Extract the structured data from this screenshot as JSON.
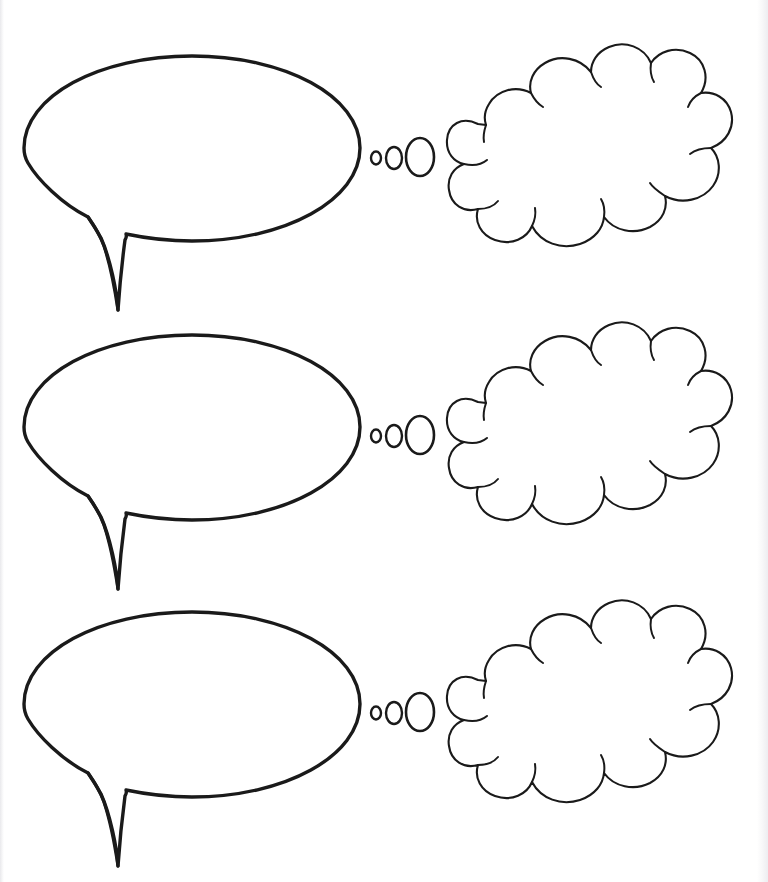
{
  "page": {
    "background_color": "#ffffff",
    "ink_color": "#1a1a1a",
    "page_edge_color": "#e9e9ec",
    "width": 768,
    "height": 882,
    "header_clipped_text": "",
    "orientation": "portrait"
  },
  "rows": [
    {
      "index": 1,
      "label": "bubble-pair-row-1",
      "speech_bubble": {
        "name": "speech-bubble-1",
        "shape": "ellipse-with-tail",
        "center_x": 192,
        "center_y": 148,
        "radius_x": 168,
        "radius_y": 93,
        "tail_direction": "down-left",
        "fill": "#ffffff",
        "stroke": "#1a1a1a",
        "stroke_width": 3.4,
        "content": ""
      },
      "dots": {
        "name": "thought-trail-1",
        "count": 3,
        "sizes": [
          "small",
          "medium",
          "large"
        ],
        "center_y": 158
      },
      "thought_bubble": {
        "name": "thought-bubble-1",
        "shape": "cloud",
        "left": 448,
        "top": 54,
        "width": 288,
        "height": 192,
        "scallop_count": 13,
        "fill": "#ffffff",
        "stroke": "#1a1a1a",
        "stroke_width": 2.1,
        "content": ""
      }
    },
    {
      "index": 2,
      "label": "bubble-pair-row-2",
      "speech_bubble": {
        "name": "speech-bubble-2",
        "shape": "ellipse-with-tail",
        "center_x": 192,
        "center_y": 427,
        "radius_x": 168,
        "radius_y": 93,
        "tail_direction": "down-left",
        "fill": "#ffffff",
        "stroke": "#1a1a1a",
        "stroke_width": 3.4,
        "content": ""
      },
      "dots": {
        "name": "thought-trail-2",
        "count": 3,
        "sizes": [
          "small",
          "medium",
          "large"
        ],
        "center_y": 436
      },
      "thought_bubble": {
        "name": "thought-bubble-2",
        "shape": "cloud",
        "left": 448,
        "top": 332,
        "width": 288,
        "height": 192,
        "scallop_count": 13,
        "fill": "#ffffff",
        "stroke": "#1a1a1a",
        "stroke_width": 2.1,
        "content": ""
      }
    },
    {
      "index": 3,
      "label": "bubble-pair-row-3",
      "speech_bubble": {
        "name": "speech-bubble-3",
        "shape": "ellipse-with-tail",
        "center_x": 192,
        "center_y": 704,
        "radius_x": 168,
        "radius_y": 93,
        "tail_direction": "down-left",
        "fill": "#ffffff",
        "stroke": "#1a1a1a",
        "stroke_width": 3.4,
        "content": ""
      },
      "dots": {
        "name": "thought-trail-3",
        "count": 3,
        "sizes": [
          "small",
          "medium",
          "large"
        ],
        "center_y": 713
      },
      "thought_bubble": {
        "name": "thought-bubble-3",
        "shape": "cloud",
        "left": 448,
        "top": 610,
        "width": 288,
        "height": 192,
        "scallop_count": 13,
        "fill": "#ffffff",
        "stroke": "#1a1a1a",
        "stroke_width": 2.1,
        "content": ""
      }
    }
  ]
}
